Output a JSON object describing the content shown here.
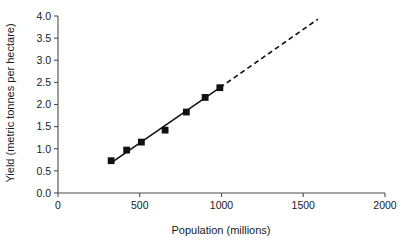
{
  "chart_data": {
    "type": "scatter",
    "title": "",
    "xlabel": "Population (millions)",
    "ylabel": "Yield (metric tonnes per hectare)",
    "xlim": [
      0,
      2000
    ],
    "ylim": [
      0.0,
      4.0
    ],
    "xticks": [
      0,
      500,
      1000,
      1500,
      2000
    ],
    "xtick_labels": [
      "0",
      "500",
      "1000",
      "1500",
      "2000"
    ],
    "yticks": [
      0.0,
      0.5,
      1.0,
      1.5,
      2.0,
      2.5,
      3.0,
      3.5,
      4.0
    ],
    "ytick_labels": [
      "0.0",
      "0.5",
      "1.0",
      "1.5",
      "2.0",
      "2.5",
      "3.0",
      "3.5",
      "4.0"
    ],
    "grid": false,
    "legend": false,
    "marker_style": "filled-square",
    "marker_color": "#111111",
    "line_color": "#111111",
    "points": [
      {
        "x": 325,
        "y": 0.73
      },
      {
        "x": 420,
        "y": 0.97
      },
      {
        "x": 510,
        "y": 1.15
      },
      {
        "x": 655,
        "y": 1.42
      },
      {
        "x": 785,
        "y": 1.83
      },
      {
        "x": 900,
        "y": 2.16
      },
      {
        "x": 990,
        "y": 2.38
      }
    ],
    "series": [
      {
        "name": "fitted-trend-observed",
        "style": "solid",
        "x": [
          340,
          990
        ],
        "y": [
          0.72,
          2.38
        ]
      },
      {
        "name": "fitted-trend-extrapolated",
        "style": "dashed",
        "x": [
          990,
          1590
        ],
        "y": [
          2.38,
          3.93
        ]
      }
    ]
  }
}
